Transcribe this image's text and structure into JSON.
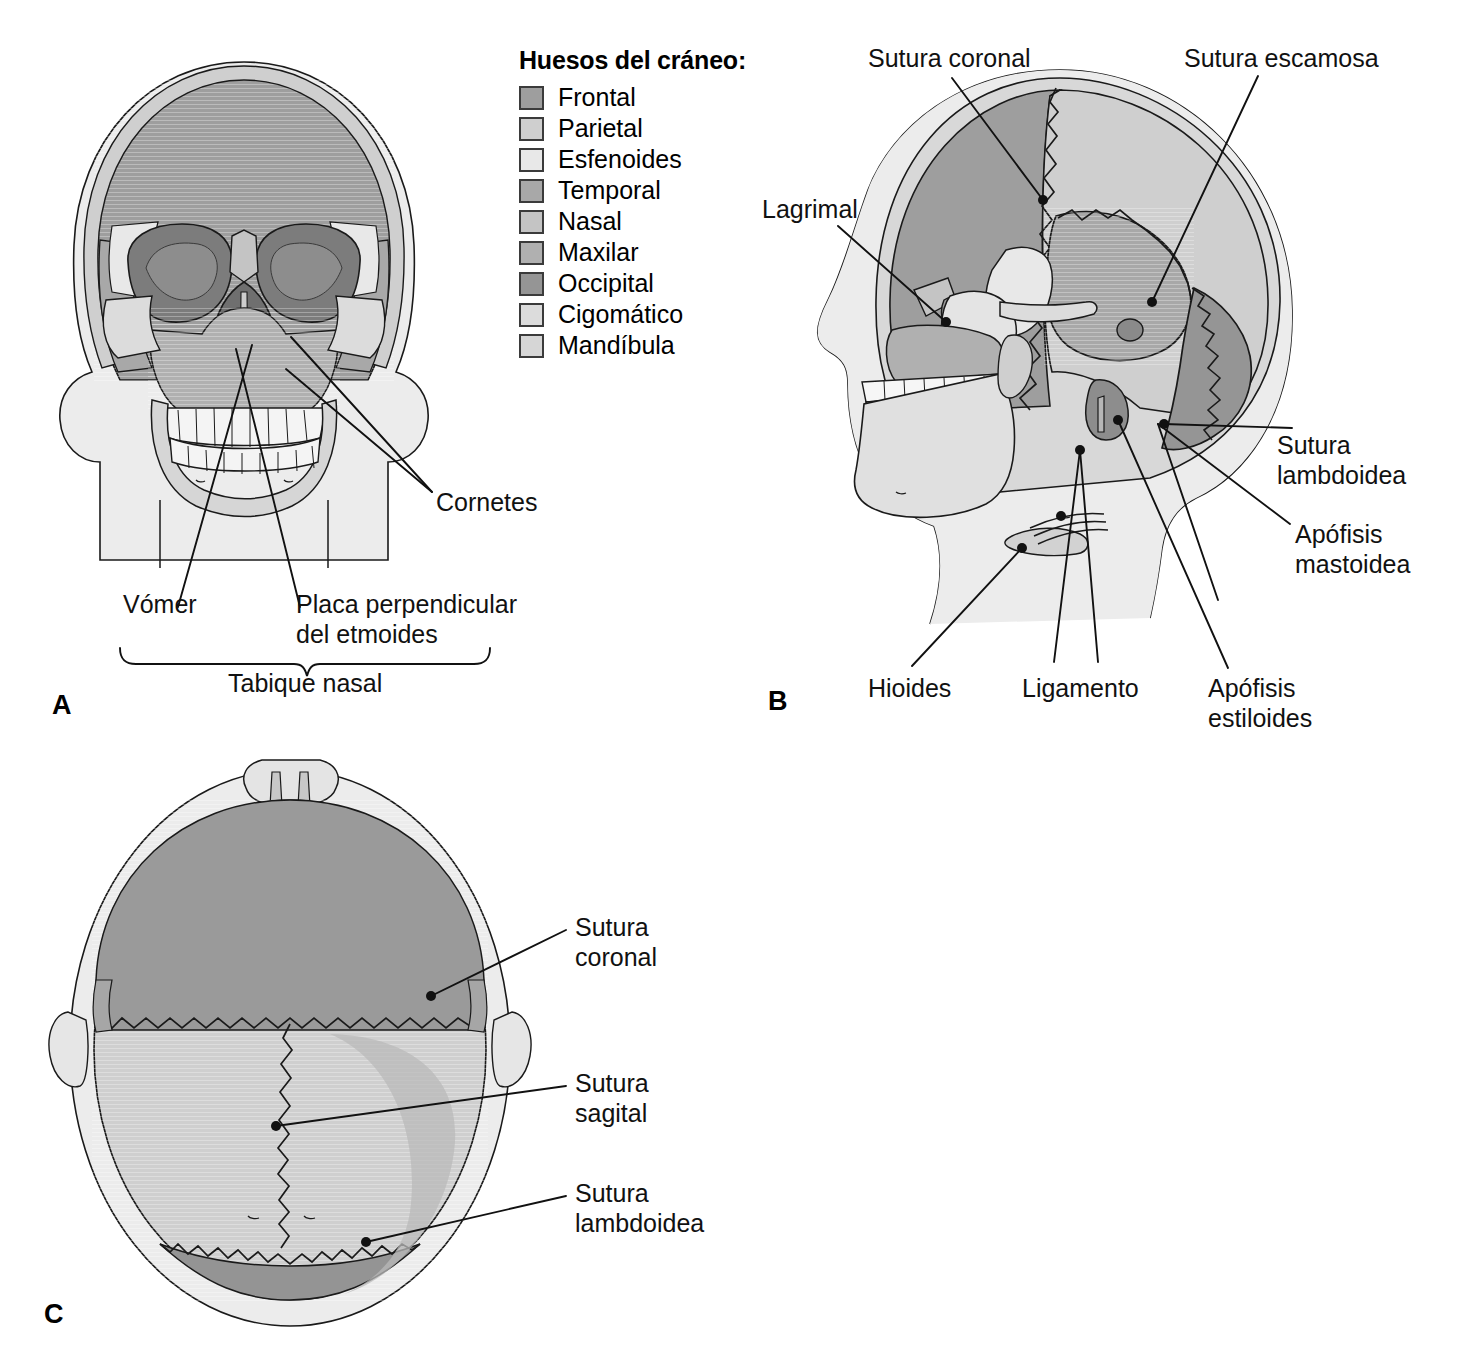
{
  "figure": {
    "kind": "anatomical-illustration",
    "panels": [
      {
        "id": "A",
        "letter": "A",
        "view": "anterior"
      },
      {
        "id": "B",
        "letter": "B",
        "view": "lateral"
      },
      {
        "id": "C",
        "letter": "C",
        "view": "superior"
      }
    ]
  },
  "legend": {
    "title": "Huesos del cráneo:",
    "items": [
      {
        "name": "Frontal",
        "color": "#9e9e9e"
      },
      {
        "name": "Parietal",
        "color": "#cfcfcf"
      },
      {
        "name": "Esfenoides",
        "color": "#e8e8e8"
      },
      {
        "name": "Temporal",
        "color": "#a8a8a8"
      },
      {
        "name": "Nasal",
        "color": "#c4c4c4"
      },
      {
        "name": "Maxilar",
        "color": "#b0b0b0"
      },
      {
        "name": "Occipital",
        "color": "#959595"
      },
      {
        "name": "Cigomático",
        "color": "#dcdcdc"
      },
      {
        "name": "Mandíbula",
        "color": "#d6d6d6"
      }
    ]
  },
  "panel_a": {
    "letter": "A",
    "labels": {
      "cornetes": "Cornetes",
      "vomer": "Vómer",
      "placa_line1": "Placa perpendicular",
      "placa_line2": "del etmoides",
      "tabique": "Tabique nasal"
    }
  },
  "panel_b": {
    "letter": "B",
    "labels": {
      "sutura_coronal": "Sutura coronal",
      "sutura_escamosa": "Sutura escamosa",
      "lagrimal": "Lagrimal",
      "sutura_lambdoidea_l1": "Sutura",
      "sutura_lambdoidea_l2": "lambdoidea",
      "apofisis_mastoidea_l1": "Apófisis",
      "apofisis_mastoidea_l2": "mastoidea",
      "hioides": "Hioides",
      "ligamento": "Ligamento",
      "apofisis_estiloides_l1": "Apófisis",
      "apofisis_estiloides_l2": "estiloides"
    }
  },
  "panel_c": {
    "letter": "C",
    "labels": {
      "sutura_coronal_l1": "Sutura",
      "sutura_coronal_l2": "coronal",
      "sutura_sagital_l1": "Sutura",
      "sutura_sagital_l2": "sagital",
      "sutura_lambdoidea_l1": "Sutura",
      "sutura_lambdoidea_l2": "lambdoidea"
    }
  },
  "palette": {
    "outline": "#1a1a1a",
    "skin": "#ececec",
    "frontal": "#9e9e9e",
    "parietal": "#cfcfcf",
    "esfenoides": "#e8e8e8",
    "temporal": "#a8a8a8",
    "nasal": "#c4c4c4",
    "maxilar": "#b0b0b0",
    "occipital": "#959595",
    "cigomatico": "#dcdcdc",
    "mandibula": "#d6d6d6",
    "cavity": "#7c7c7c",
    "teeth": "#f4f4f4"
  }
}
